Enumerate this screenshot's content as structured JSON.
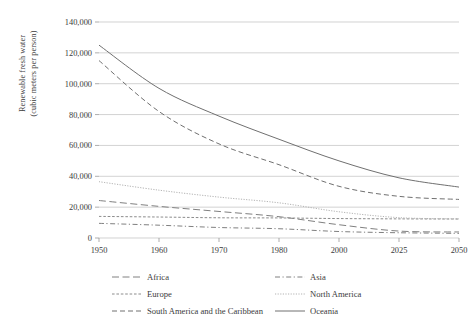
{
  "chart_data": {
    "type": "line",
    "title": "",
    "xlabel": "",
    "ylabel_line1": "Renewable fresh water",
    "ylabel_line2": "(cubic meters per person)",
    "categories": [
      "1950",
      "1960",
      "1970",
      "1980",
      "2000",
      "2025",
      "2050"
    ],
    "x_tick_labels": [
      "1950",
      "1960",
      "1970",
      "1980",
      "2000",
      "2025",
      "2050"
    ],
    "y_tick_labels": [
      "0",
      "20,000",
      "40,000",
      "60,000",
      "80,000",
      "100,000",
      "120,000",
      "140,000"
    ],
    "y_tick_values": [
      0,
      20000,
      40000,
      60000,
      80000,
      100000,
      120000,
      140000
    ],
    "ylim": [
      0,
      140000
    ],
    "grid": "horizontal",
    "legend_position": "bottom",
    "series": [
      {
        "name": "Africa",
        "style": "long-dash",
        "color": "#808080",
        "values": [
          24300,
          20500,
          17200,
          13800,
          8600,
          4500,
          3900
        ]
      },
      {
        "name": "Asia",
        "style": "dash-dot",
        "color": "#808080",
        "values": [
          9500,
          8300,
          6800,
          6000,
          4200,
          3400,
          3000
        ]
      },
      {
        "name": "Europe",
        "style": "dotted",
        "color": "#8c8c8c",
        "values": [
          14000,
          13600,
          13100,
          13000,
          12600,
          12400,
          12300
        ]
      },
      {
        "name": "North America",
        "style": "fine-dotted",
        "color": "#b3b3b3",
        "values": [
          36500,
          31000,
          26500,
          22800,
          17000,
          13200,
          12400
        ]
      },
      {
        "name": "South America and the Caribbean",
        "style": "medium-dash",
        "color": "#707070",
        "values": [
          115000,
          82000,
          61000,
          47500,
          33500,
          27000,
          25000
        ]
      },
      {
        "name": "Oceania",
        "style": "solid",
        "color": "#707070",
        "values": [
          125000,
          97000,
          79000,
          64000,
          50000,
          39000,
          33000
        ]
      }
    ],
    "legend_entries": [
      {
        "label": "Africa",
        "style": "long-dash",
        "color": "#808080"
      },
      {
        "label": "Asia",
        "style": "dash-dot",
        "color": "#808080"
      },
      {
        "label": "Europe",
        "style": "dotted",
        "color": "#8c8c8c"
      },
      {
        "label": "North America",
        "style": "fine-dotted",
        "color": "#b3b3b3"
      },
      {
        "label": "South America and the Caribbean",
        "style": "medium-dash",
        "color": "#707070"
      },
      {
        "label": "Oceania",
        "style": "solid",
        "color": "#707070"
      }
    ]
  }
}
